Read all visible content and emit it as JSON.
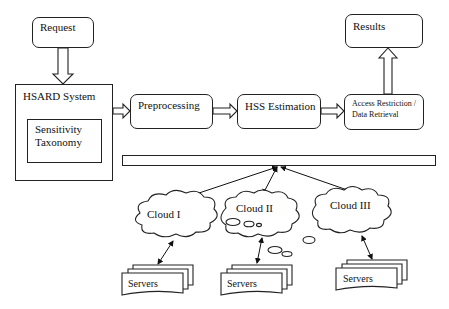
{
  "diagram": {
    "nodes": {
      "request": "Request",
      "system": "HSARD System",
      "taxonomy_line1": "Sensitivity",
      "taxonomy_line2": "Taxonomy",
      "preprocessing": "Preprocessing",
      "hss": "HSS Estimation",
      "access_line1": "Access Restriction /",
      "access_line2": "Data Retrieval",
      "results": "Results",
      "cloud1": "Cloud I",
      "cloud2": "Cloud II",
      "cloud3": "Cloud III",
      "servers1": "Servers",
      "servers2": "Servers",
      "servers3": "Servers"
    },
    "edges": [
      {
        "from": "Request",
        "to": "HSARD System",
        "style": "hollow-arrow"
      },
      {
        "from": "HSARD System",
        "to": "Preprocessing",
        "style": "hollow-arrow"
      },
      {
        "from": "Preprocessing",
        "to": "HSS Estimation",
        "style": "hollow-arrow"
      },
      {
        "from": "HSS Estimation",
        "to": "Access Restriction / Data Retrieval",
        "style": "hollow-arrow"
      },
      {
        "from": "Access Restriction / Data Retrieval",
        "to": "Results",
        "style": "hollow-arrow"
      },
      {
        "from": "Bus",
        "to": "Cloud I",
        "style": "bidirectional"
      },
      {
        "from": "Bus",
        "to": "Cloud II",
        "style": "bidirectional"
      },
      {
        "from": "Bus",
        "to": "Cloud III",
        "style": "bidirectional"
      },
      {
        "from": "Cloud I",
        "to": "Servers",
        "style": "bidirectional"
      },
      {
        "from": "Cloud II",
        "to": "Servers",
        "style": "bidirectional"
      },
      {
        "from": "Cloud III",
        "to": "Servers",
        "style": "bidirectional"
      }
    ]
  }
}
